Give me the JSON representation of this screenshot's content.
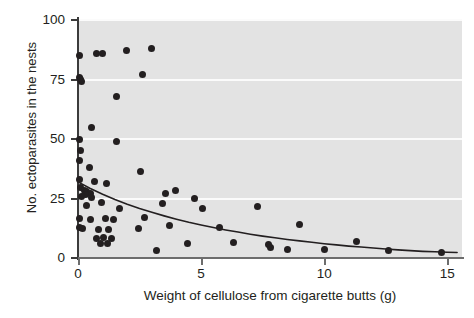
{
  "chart_data": {
    "type": "scatter",
    "title": "",
    "xlabel": "Weight of cellulose from cigarette butts (g)",
    "ylabel": "No. ectoparasites in the nests",
    "xlim": [
      0,
      15.6
    ],
    "ylim": [
      0,
      100
    ],
    "xticks": [
      0,
      5,
      10,
      15
    ],
    "yticks": [
      0,
      25,
      50,
      75,
      100
    ],
    "xtick_labels": [
      "0",
      "5",
      "10",
      "15"
    ],
    "ytick_labels": [
      "0",
      "25",
      "50",
      "75",
      "100"
    ],
    "grid": "horizontal-white-gridlines-on-gray-panel",
    "legend": "none",
    "marker_color": "#231f20",
    "panel_color": "#e3e3e3",
    "gridline_color": "#fbfbfb",
    "points": [
      [
        0.05,
        85.0
      ],
      [
        0.75,
        86.0
      ],
      [
        1.0,
        86.0
      ],
      [
        1.95,
        87.0
      ],
      [
        3.0,
        88.0
      ],
      [
        0.05,
        76.0
      ],
      [
        0.1,
        75.0
      ],
      [
        0.15,
        74.0
      ],
      [
        2.6,
        77.0
      ],
      [
        1.55,
        68.0
      ],
      [
        0.55,
        55.0
      ],
      [
        0.05,
        50.0
      ],
      [
        1.55,
        49.0
      ],
      [
        0.1,
        45.0
      ],
      [
        0.05,
        41.0
      ],
      [
        0.45,
        38.0
      ],
      [
        2.55,
        36.5
      ],
      [
        0.05,
        33.0
      ],
      [
        0.65,
        32.0
      ],
      [
        1.15,
        31.5
      ],
      [
        0.1,
        29.5
      ],
      [
        0.25,
        28.5
      ],
      [
        0.35,
        28.0
      ],
      [
        0.5,
        27.0
      ],
      [
        0.3,
        26.5
      ],
      [
        0.15,
        26.0
      ],
      [
        0.55,
        25.5
      ],
      [
        3.55,
        27.0
      ],
      [
        3.95,
        28.5
      ],
      [
        4.75,
        25.0
      ],
      [
        3.45,
        23.0
      ],
      [
        0.95,
        23.5
      ],
      [
        0.35,
        22.0
      ],
      [
        1.7,
        21.0
      ],
      [
        5.05,
        21.0
      ],
      [
        7.3,
        21.5
      ],
      [
        0.05,
        16.5
      ],
      [
        0.5,
        16.0
      ],
      [
        1.1,
        16.5
      ],
      [
        1.45,
        16.0
      ],
      [
        2.7,
        17.0
      ],
      [
        0.05,
        13.0
      ],
      [
        0.2,
        12.5
      ],
      [
        0.85,
        12.0
      ],
      [
        1.25,
        12.0
      ],
      [
        2.45,
        12.5
      ],
      [
        3.7,
        13.5
      ],
      [
        5.75,
        13.0
      ],
      [
        9.0,
        14.0
      ],
      [
        0.75,
        8.0
      ],
      [
        1.05,
        8.5
      ],
      [
        1.35,
        8.0
      ],
      [
        0.9,
        6.0
      ],
      [
        1.2,
        6.0
      ],
      [
        4.45,
        6.0
      ],
      [
        6.3,
        6.5
      ],
      [
        7.75,
        5.5
      ],
      [
        7.8,
        4.5
      ],
      [
        11.3,
        7.0
      ],
      [
        3.2,
        3.0
      ],
      [
        8.5,
        3.5
      ],
      [
        10.0,
        3.5
      ],
      [
        12.6,
        3.0
      ],
      [
        14.75,
        2.5
      ]
    ],
    "fit_curve": {
      "description": "decaying exponential trend line",
      "points": [
        [
          0.0,
          32.0
        ],
        [
          0.5,
          29.2
        ],
        [
          1.0,
          26.8
        ],
        [
          1.5,
          24.6
        ],
        [
          2.0,
          22.6
        ],
        [
          2.5,
          20.8
        ],
        [
          3.0,
          19.2
        ],
        [
          3.5,
          17.7
        ],
        [
          4.0,
          16.3
        ],
        [
          4.5,
          15.0
        ],
        [
          5.0,
          13.9
        ],
        [
          5.5,
          12.8
        ],
        [
          6.0,
          11.8
        ],
        [
          6.5,
          10.9
        ],
        [
          7.0,
          10.0
        ],
        [
          7.5,
          9.2
        ],
        [
          8.0,
          8.5
        ],
        [
          8.5,
          7.8
        ],
        [
          9.0,
          7.2
        ],
        [
          9.5,
          6.6
        ],
        [
          10.0,
          6.0
        ],
        [
          10.5,
          5.5
        ],
        [
          11.0,
          5.0
        ],
        [
          11.5,
          4.6
        ],
        [
          12.0,
          4.2
        ],
        [
          12.5,
          3.8
        ],
        [
          13.0,
          3.4
        ],
        [
          13.5,
          3.1
        ],
        [
          14.0,
          2.8
        ],
        [
          14.5,
          2.6
        ],
        [
          15.0,
          2.4
        ],
        [
          15.4,
          2.3
        ]
      ]
    }
  }
}
